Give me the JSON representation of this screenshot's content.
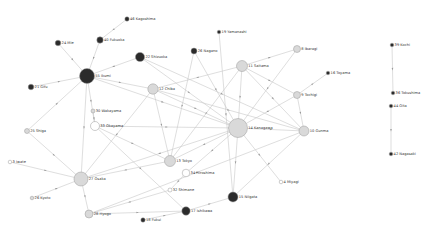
{
  "diagram": {
    "type": "network",
    "colors": {
      "dark": "#2b2b2b",
      "light": "#d9d9d9",
      "white": "#ffffff",
      "edge": "#c8c8c8"
    },
    "nodes": [
      {
        "id": "46",
        "label": "46 Kagoshima",
        "x": 127,
        "y": 19,
        "r": 2.2,
        "fill": "dark"
      },
      {
        "id": "40",
        "label": "40 Fukuoka",
        "x": 100,
        "y": 40,
        "r": 3.2,
        "fill": "dark"
      },
      {
        "id": "24",
        "label": "24 Mie",
        "x": 58,
        "y": 43,
        "r": 2.8,
        "fill": "dark"
      },
      {
        "id": "22",
        "label": "22 Shizuoka",
        "x": 140,
        "y": 57,
        "r": 4.6,
        "fill": "dark"
      },
      {
        "id": "26",
        "label": "26 Nagano",
        "x": 194,
        "y": 51,
        "r": 3.0,
        "fill": "dark"
      },
      {
        "id": "19",
        "label": "19 Yamanashi",
        "x": 219,
        "y": 32,
        "r": 1.8,
        "fill": "dark"
      },
      {
        "id": "55",
        "label": "55 Ikumi",
        "x": 87,
        "y": 76,
        "r": 7.5,
        "fill": "dark"
      },
      {
        "id": "21",
        "label": "21 Gifu",
        "x": 31,
        "y": 87,
        "r": 2.8,
        "fill": "dark"
      },
      {
        "id": "11",
        "label": "11 Saitama",
        "x": 242,
        "y": 66,
        "r": 5.5,
        "fill": "light"
      },
      {
        "id": "12",
        "label": "12 Chiba",
        "x": 153,
        "y": 89,
        "r": 5.2,
        "fill": "light"
      },
      {
        "id": "8",
        "label": "8 Ibaragi",
        "x": 297,
        "y": 49,
        "r": 3.5,
        "fill": "light"
      },
      {
        "id": "16",
        "label": "16 Toyama",
        "x": 328,
        "y": 73,
        "r": 1.8,
        "fill": "dark"
      },
      {
        "id": "9",
        "label": "9 Tochigi",
        "x": 297,
        "y": 95,
        "r": 3.5,
        "fill": "light"
      },
      {
        "id": "30",
        "label": "30 Wakayama",
        "x": 93,
        "y": 111,
        "r": 2.0,
        "fill": "light"
      },
      {
        "id": "33",
        "label": "33 Okayama",
        "x": 95,
        "y": 126,
        "r": 4.5,
        "fill": "white"
      },
      {
        "id": "14",
        "label": "14 Kanagawa",
        "x": 238,
        "y": 128,
        "r": 9.5,
        "fill": "light"
      },
      {
        "id": "10",
        "label": "10 Gunma",
        "x": 304,
        "y": 131,
        "r": 5.0,
        "fill": "light"
      },
      {
        "id": "25",
        "label": "25 Shiga",
        "x": 27,
        "y": 131,
        "r": 2.5,
        "fill": "light"
      },
      {
        "id": "13",
        "label": "13 Tokyo",
        "x": 170,
        "y": 161,
        "r": 5.5,
        "fill": "light"
      },
      {
        "id": "34",
        "label": "34 Hiroshima",
        "x": 186,
        "y": 173,
        "r": 3.8,
        "fill": "white"
      },
      {
        "id": "3",
        "label": "3 Iwate",
        "x": 10,
        "y": 162,
        "r": 1.8,
        "fill": "white"
      },
      {
        "id": "27",
        "label": "27 Osaka",
        "x": 81,
        "y": 179,
        "r": 7.0,
        "fill": "light"
      },
      {
        "id": "32",
        "label": "32 Shimane",
        "x": 170,
        "y": 190,
        "r": 2.0,
        "fill": "white"
      },
      {
        "id": "4",
        "label": "4 Miyagi",
        "x": 281,
        "y": 182,
        "r": 1.8,
        "fill": "white"
      },
      {
        "id": "15",
        "label": "15 Niigata",
        "x": 233,
        "y": 197,
        "r": 5.0,
        "fill": "dark"
      },
      {
        "id": "26b",
        "label": "26 Kyoto",
        "x": 32,
        "y": 198,
        "r": 1.8,
        "fill": "light"
      },
      {
        "id": "28",
        "label": "28 Hyogo",
        "x": 89,
        "y": 214,
        "r": 4.0,
        "fill": "light"
      },
      {
        "id": "17",
        "label": "17 Ishikawa",
        "x": 186,
        "y": 211,
        "r": 4.2,
        "fill": "dark"
      },
      {
        "id": "18",
        "label": "18 Fukui",
        "x": 143,
        "y": 220,
        "r": 2.2,
        "fill": "dark"
      },
      {
        "id": "39",
        "label": "39 Kochi",
        "x": 392,
        "y": 45,
        "r": 1.8,
        "fill": "dark"
      },
      {
        "id": "36",
        "label": "36 Tokushima",
        "x": 393,
        "y": 93,
        "r": 1.8,
        "fill": "dark"
      },
      {
        "id": "44",
        "label": "44 Oita",
        "x": 391,
        "y": 106,
        "r": 1.8,
        "fill": "dark"
      },
      {
        "id": "42",
        "label": "42 Nagasaki",
        "x": 391,
        "y": 154,
        "r": 1.8,
        "fill": "dark"
      }
    ],
    "edges": [
      [
        "46",
        "40"
      ],
      [
        "40",
        "55"
      ],
      [
        "24",
        "55"
      ],
      [
        "22",
        "55"
      ],
      [
        "21",
        "55"
      ],
      [
        "55",
        "27"
      ],
      [
        "55",
        "33"
      ],
      [
        "55",
        "14"
      ],
      [
        "55",
        "12"
      ],
      [
        "25",
        "55"
      ],
      [
        "25",
        "27"
      ],
      [
        "26",
        "14"
      ],
      [
        "26",
        "13"
      ],
      [
        "19",
        "15"
      ],
      [
        "11",
        "12"
      ],
      [
        "11",
        "8"
      ],
      [
        "11",
        "9"
      ],
      [
        "11",
        "14"
      ],
      [
        "11",
        "10"
      ],
      [
        "11",
        "13"
      ],
      [
        "12",
        "14"
      ],
      [
        "12",
        "13"
      ],
      [
        "12",
        "10"
      ],
      [
        "8",
        "14"
      ],
      [
        "9",
        "16"
      ],
      [
        "9",
        "14"
      ],
      [
        "9",
        "10"
      ],
      [
        "22",
        "14"
      ],
      [
        "22",
        "10"
      ],
      [
        "33",
        "14"
      ],
      [
        "33",
        "13"
      ],
      [
        "33",
        "17"
      ],
      [
        "30",
        "33"
      ],
      [
        "14",
        "10"
      ],
      [
        "14",
        "15"
      ],
      [
        "14",
        "4"
      ],
      [
        "14",
        "27"
      ],
      [
        "14",
        "13"
      ],
      [
        "14",
        "34"
      ],
      [
        "10",
        "15"
      ],
      [
        "10",
        "28"
      ],
      [
        "13",
        "27"
      ],
      [
        "34",
        "32"
      ],
      [
        "32",
        "28"
      ],
      [
        "3",
        "27"
      ],
      [
        "26b",
        "27"
      ],
      [
        "27",
        "28"
      ],
      [
        "27",
        "12"
      ],
      [
        "28",
        "17"
      ],
      [
        "18",
        "17"
      ],
      [
        "17",
        "15"
      ],
      [
        "39",
        "36"
      ],
      [
        "44",
        "42"
      ]
    ]
  }
}
